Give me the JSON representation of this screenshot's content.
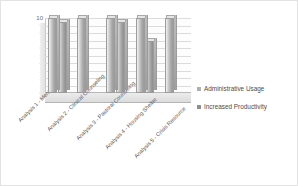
{
  "chart_data": {
    "type": "bar",
    "title": "",
    "subtitle": "",
    "xlabel": "",
    "ylabel": "",
    "ylim": [
      0,
      10
    ],
    "yticks": [
      10,
      9,
      8,
      7,
      6,
      5,
      4,
      3,
      2,
      1,
      0
    ],
    "grid": true,
    "legend_position": "right",
    "three_d": true,
    "categories": [
      "Analysis 1 - Mentoring",
      "Analysis 2 - Clinical Counseling",
      "Analysis 3 - Pastoral Counseling",
      "Analysis 4 - Housing Shelter",
      "Analysis 5 - Crisis Resource"
    ],
    "series": [
      {
        "name": "Administrative Usage",
        "color": "#b0b0b0",
        "values": [
          10,
          10,
          10,
          10,
          10
        ]
      },
      {
        "name": "Increased Productivity",
        "color": "#9a9a9a",
        "values": [
          9.5,
          0,
          9.5,
          7,
          0
        ]
      }
    ]
  },
  "legend": {
    "items": [
      {
        "label": "Administrative Usage",
        "marker": "square-swatch",
        "color": "#b0b0b0"
      },
      {
        "label": "Increased Productivity",
        "marker": "square-swatch",
        "color": "#8f8f8f"
      }
    ]
  }
}
